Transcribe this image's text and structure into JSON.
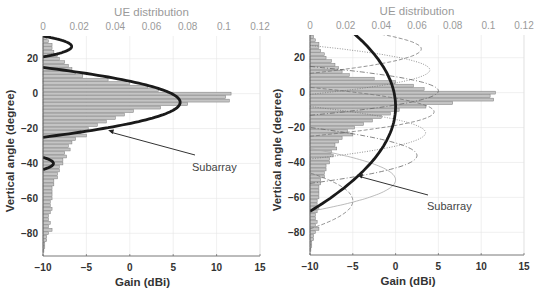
{
  "chart_data": [
    {
      "type": "bar",
      "orientation": "horizontal",
      "panel": "left",
      "title": "UE distribution",
      "xlabel": "Gain (dBi)",
      "ylabel": "Vertical angle (degree)",
      "top_axis": {
        "label": "UE distribution",
        "ticks": [
          "0",
          "0.02",
          "0.04",
          "0.06",
          "0.08",
          "0.1",
          "0.12"
        ],
        "range": [
          0,
          0.12
        ]
      },
      "bottom_axis": {
        "label": "Gain (dBi)",
        "ticks": [
          "-10",
          "-5",
          "0",
          "5",
          "10",
          "15"
        ],
        "range": [
          -10,
          15
        ]
      },
      "left_axis": {
        "ticks": [
          "20",
          "0",
          "-20",
          "-40",
          "-60",
          "-80"
        ],
        "range": [
          -93,
          33
        ]
      },
      "grid": true,
      "histogram": {
        "bin_width_deg": 2,
        "angles": [
          32,
          30,
          28,
          26,
          24,
          22,
          20,
          18,
          16,
          14,
          12,
          10,
          8,
          6,
          4,
          2,
          0,
          -2,
          -4,
          -6,
          -8,
          -10,
          -12,
          -14,
          -16,
          -18,
          -20,
          -22,
          -24,
          -26,
          -28,
          -30,
          -32,
          -34,
          -36,
          -38,
          -40,
          -42,
          -44,
          -46,
          -48,
          -50,
          -52,
          -54,
          -56,
          -58,
          -60,
          -62,
          -64,
          -66,
          -68,
          -70,
          -72,
          -74,
          -76,
          -78,
          -80,
          -82,
          -84,
          -86,
          -88,
          -90
        ],
        "values": [
          0.002,
          0.003,
          0.005,
          0.005,
          0.006,
          0.008,
          0.009,
          0.012,
          0.014,
          0.016,
          0.018,
          0.022,
          0.036,
          0.048,
          0.058,
          0.064,
          0.104,
          0.101,
          0.103,
          0.08,
          0.065,
          0.05,
          0.045,
          0.04,
          0.035,
          0.03,
          0.025,
          0.021,
          0.024,
          0.018,
          0.016,
          0.014,
          0.015,
          0.012,
          0.013,
          0.011,
          0.011,
          0.009,
          0.009,
          0.008,
          0.008,
          0.006,
          0.006,
          0.005,
          0.005,
          0.005,
          0.005,
          0.004,
          0.004,
          0.005,
          0.004,
          0.003,
          0.003,
          0.004,
          0.003,
          0.005,
          0.003,
          0.002,
          0.002,
          0.001,
          0.001,
          0.0005
        ]
      },
      "series": [
        {
          "name": "Subarray",
          "style": "thick-solid",
          "lobes": [
            {
              "center_deg": -5,
              "half_width_deg": 20,
              "peak_gain": 5.8
            },
            {
              "center_deg": 27,
              "half_width_deg": 6,
              "peak_gain": -6.7
            },
            {
              "center_deg": -40,
              "half_width_deg": 3.5,
              "peak_gain": -8.8
            }
          ]
        }
      ],
      "annotations": [
        {
          "text": "Subarray",
          "arrow_to": {
            "gain": -2.5,
            "angle": -21
          }
        }
      ]
    },
    {
      "type": "bar",
      "orientation": "horizontal",
      "panel": "right",
      "title": "UE distribution",
      "xlabel": "Gain (dBi)",
      "ylabel": "Vertical angle (degree)",
      "top_axis": {
        "label": "UE distribution",
        "ticks": [
          "0",
          "0.02",
          "0.04",
          "0.06",
          "0.08",
          "0.1",
          "0.12"
        ],
        "range": [
          0,
          0.12
        ]
      },
      "bottom_axis": {
        "label": "Gain (dBi)",
        "ticks": [
          "-10",
          "-5",
          "0",
          "5",
          "10",
          "15"
        ],
        "range": [
          -10,
          15
        ]
      },
      "left_axis": {
        "ticks": [
          "20",
          "0",
          "-20",
          "-40",
          "-60",
          "-80"
        ],
        "range": [
          -93,
          33
        ]
      },
      "grid": true,
      "histogram_same_as": "left",
      "series": [
        {
          "name": "Subarray",
          "style": "thick-solid",
          "lobes": [
            {
              "center_deg": -8,
              "half_width_deg": 60,
              "peak_gain": 0.0
            }
          ]
        },
        {
          "name": "beam-1",
          "style": "thin-dashed",
          "lobes": [
            {
              "center_deg": 25,
              "half_width_deg": 14,
              "peak_gain": 3.0
            }
          ]
        },
        {
          "name": "beam-2",
          "style": "thin-dotted",
          "lobes": [
            {
              "center_deg": 13,
              "half_width_deg": 14,
              "peak_gain": 4.0
            }
          ]
        },
        {
          "name": "beam-3",
          "style": "thin-dashdot",
          "lobes": [
            {
              "center_deg": 1,
              "half_width_deg": 14,
              "peak_gain": 5.0
            }
          ]
        },
        {
          "name": "beam-4",
          "style": "thin-dashed",
          "lobes": [
            {
              "center_deg": -11,
              "half_width_deg": 14,
              "peak_gain": 4.5
            }
          ]
        },
        {
          "name": "beam-5",
          "style": "thin-dotted",
          "lobes": [
            {
              "center_deg": -23,
              "half_width_deg": 15,
              "peak_gain": 3.5
            }
          ]
        },
        {
          "name": "beam-6",
          "style": "thin-dashdot",
          "lobes": [
            {
              "center_deg": -36,
              "half_width_deg": 16,
              "peak_gain": 2.5
            }
          ]
        },
        {
          "name": "beam-7",
          "style": "thin-solid-light",
          "lobes": [
            {
              "center_deg": -50,
              "half_width_deg": 18,
              "peak_gain": 0.0
            }
          ]
        },
        {
          "name": "beam-8",
          "style": "thin-dashed",
          "lobes": [
            {
              "center_deg": -62,
              "half_width_deg": 16,
              "peak_gain": -5.0
            }
          ]
        }
      ],
      "annotations": [
        {
          "text": "Subarray",
          "arrow_to": {
            "gain": -4.5,
            "angle": -47
          }
        }
      ]
    }
  ],
  "panels": {
    "left": {
      "title": "UE distribution",
      "xlabel": "Gain (dBi)",
      "ylabel": "Vertical angle (degree)",
      "annotation": "Subarray"
    },
    "right": {
      "title": "UE distribution",
      "xlabel": "Gain (dBi)",
      "ylabel": "Vertical angle (degree)",
      "annotation": "Subarray"
    }
  },
  "colors": {
    "bar_fill": "#c4c4c4",
    "bar_stroke": "#7a7a7a",
    "curve": "#1a1a1a",
    "thin_curve": "#8a8a8a",
    "top_axis_text": "#9a9a9a",
    "grid": "#e6e6e6"
  }
}
